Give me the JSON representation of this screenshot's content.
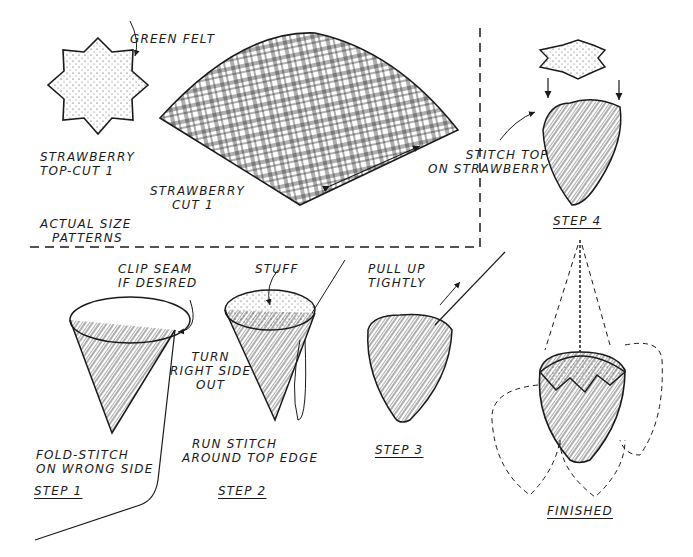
{
  "diagram": {
    "type": "craft-instruction-illustration",
    "patterns_panel": {
      "title": [
        "ACTUAL SIZE",
        "PATTERNS"
      ],
      "items": [
        {
          "id": "top",
          "label": [
            "STRAWBERRY",
            "TOP-CUT 1"
          ],
          "material_note": "GREEN FELT",
          "shape": "8-point star"
        },
        {
          "id": "body",
          "label": [
            "STRAWBERRY",
            "CUT 1"
          ],
          "shape": "quarter-circle wedge, plaid"
        }
      ]
    },
    "steps": [
      {
        "id": "step1",
        "title": "STEP 1",
        "notes": [
          [
            "CLIP SEAM",
            "IF DESIRED"
          ],
          [
            "FOLD-STITCH",
            "ON WRONG SIDE"
          ]
        ]
      },
      {
        "id": "step2",
        "title": "STEP 2",
        "notes": [
          [
            "STUFF"
          ],
          [
            "TURN",
            "RIGHT SIDE",
            "OUT"
          ],
          [
            "RUN STITCH",
            "AROUND TOP EDGE"
          ]
        ]
      },
      {
        "id": "step3",
        "title": "STEP 3",
        "notes": [
          [
            "PULL UP",
            "TIGHTLY"
          ]
        ]
      },
      {
        "id": "step4",
        "title": "STEP 4",
        "notes": [
          [
            "STITCH TOP",
            "ON STRAWBERRY"
          ]
        ]
      },
      {
        "id": "finished",
        "title": "FINISHED",
        "notes": []
      }
    ],
    "colors": {
      "ink": "#1a1a1a",
      "paper": "#ffffff"
    }
  }
}
